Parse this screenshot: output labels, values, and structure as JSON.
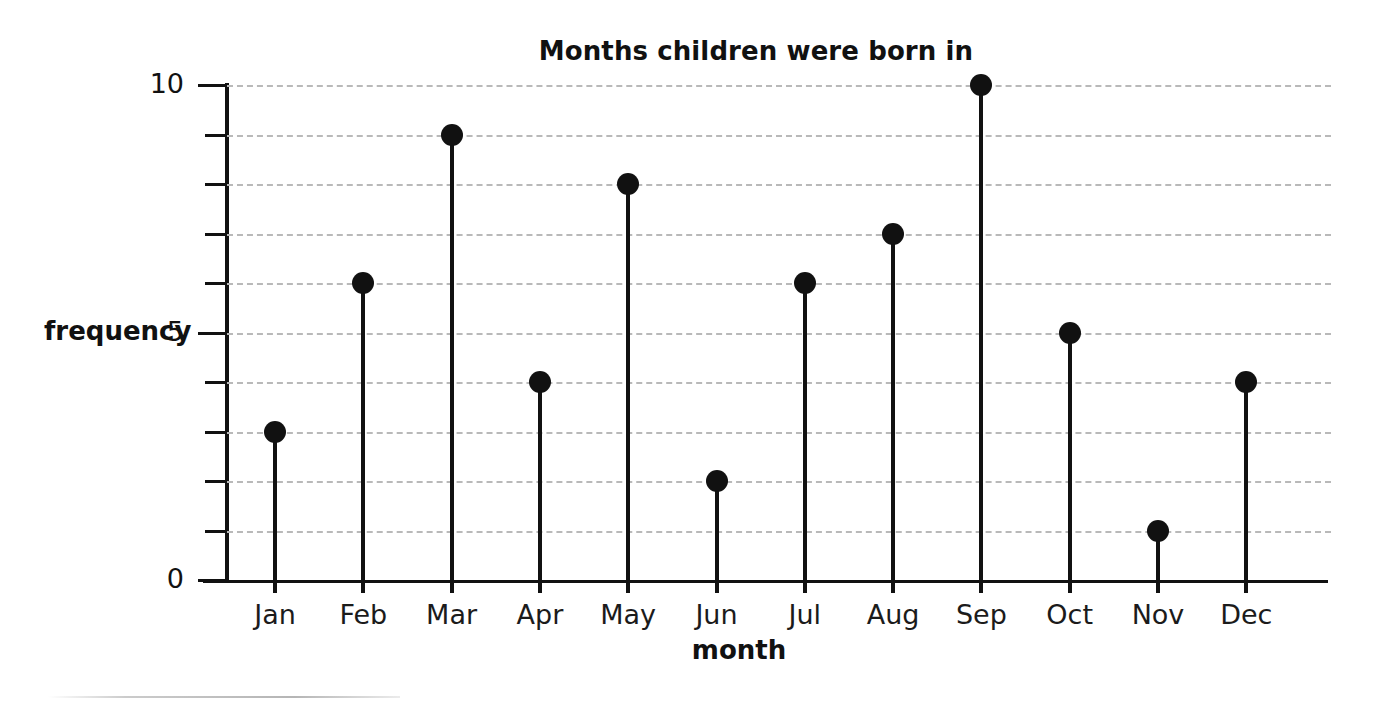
{
  "chart_data": {
    "type": "bar",
    "subtype": "stem-lollipop",
    "title": "Months children were born in",
    "xlabel": "month",
    "ylabel": "frequency",
    "categories": [
      "Jan",
      "Feb",
      "Mar",
      "Apr",
      "May",
      "Jun",
      "Jul",
      "Aug",
      "Sep",
      "Oct",
      "Nov",
      "Dec"
    ],
    "values": [
      3,
      6,
      9,
      4,
      8,
      2,
      6,
      7,
      10,
      5,
      1,
      4
    ],
    "ylim": [
      0,
      10
    ],
    "ytick_step": 1,
    "ytick_values": [
      0,
      1,
      2,
      3,
      4,
      5,
      6,
      7,
      8,
      9,
      10
    ],
    "ytick_labels_shown": {
      "0": "0",
      "5": "5",
      "10": "10"
    },
    "grid": true,
    "grid_style": "dashed",
    "grid_axis": "y",
    "legend": false,
    "marker": "filled-circle",
    "colors": {
      "ink": "#111111",
      "gridline": "#b9b9b9",
      "background": "#ffffff"
    }
  }
}
